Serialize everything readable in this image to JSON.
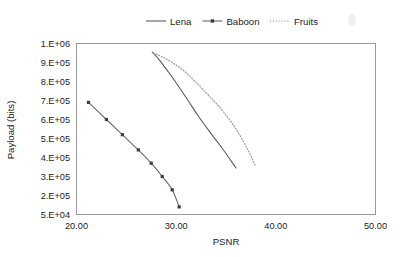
{
  "chart_data": {
    "type": "line",
    "title": "",
    "xlabel": "PSNR",
    "ylabel": "Payload (bits)",
    "xlim": [
      20.0,
      50.0
    ],
    "ylim": [
      50000,
      1000000
    ],
    "xticks": [
      "20.00",
      "30.00",
      "40.00",
      "50.00"
    ],
    "xtick_values": [
      20.0,
      30.0,
      40.0,
      50.0
    ],
    "yticks": [
      "5.E+04",
      "2.E+05",
      "3.E+05",
      "4.E+05",
      "5.E+05",
      "6.E+05",
      "7.E+05",
      "8.E+05",
      "9.E+05",
      "1.E+06"
    ],
    "ytick_values": [
      50000,
      200000,
      300000,
      400000,
      500000,
      600000,
      700000,
      800000,
      900000,
      1000000
    ],
    "grid": false,
    "legend_position": "top-center",
    "series": [
      {
        "name": "Lena",
        "style": "solid",
        "color": "#5d5d5d",
        "marker": "none",
        "x": [
          27.6,
          28.2,
          28.8,
          29.5,
          30.3,
          31.2,
          32.2,
          33.3,
          34.6,
          36.0
        ],
        "y": [
          955000,
          920000,
          880000,
          830000,
          770000,
          700000,
          620000,
          540000,
          450000,
          345000
        ]
      },
      {
        "name": "Baboon",
        "style": "solid",
        "color": "#6a6a6a",
        "marker": "square",
        "x": [
          21.2,
          23.0,
          24.6,
          26.2,
          27.5,
          28.6,
          29.6,
          30.3
        ],
        "y": [
          690000,
          600000,
          520000,
          440000,
          370000,
          300000,
          230000,
          110000
        ]
      },
      {
        "name": "Fruits",
        "style": "dotted",
        "color": "#9d9d9d",
        "marker": "none",
        "x": [
          27.7,
          28.6,
          29.6,
          30.7,
          31.9,
          33.2,
          34.6,
          36.0,
          37.2,
          37.9
        ],
        "y": [
          950000,
          930000,
          900000,
          860000,
          800000,
          730000,
          650000,
          550000,
          440000,
          360000
        ]
      }
    ]
  },
  "legend": {
    "items": [
      {
        "label": "Lena",
        "style": "solid",
        "marker": "none"
      },
      {
        "label": "Baboon",
        "style": "solid",
        "marker": "square"
      },
      {
        "label": "Fruits",
        "style": "dotted",
        "marker": "none"
      }
    ]
  }
}
